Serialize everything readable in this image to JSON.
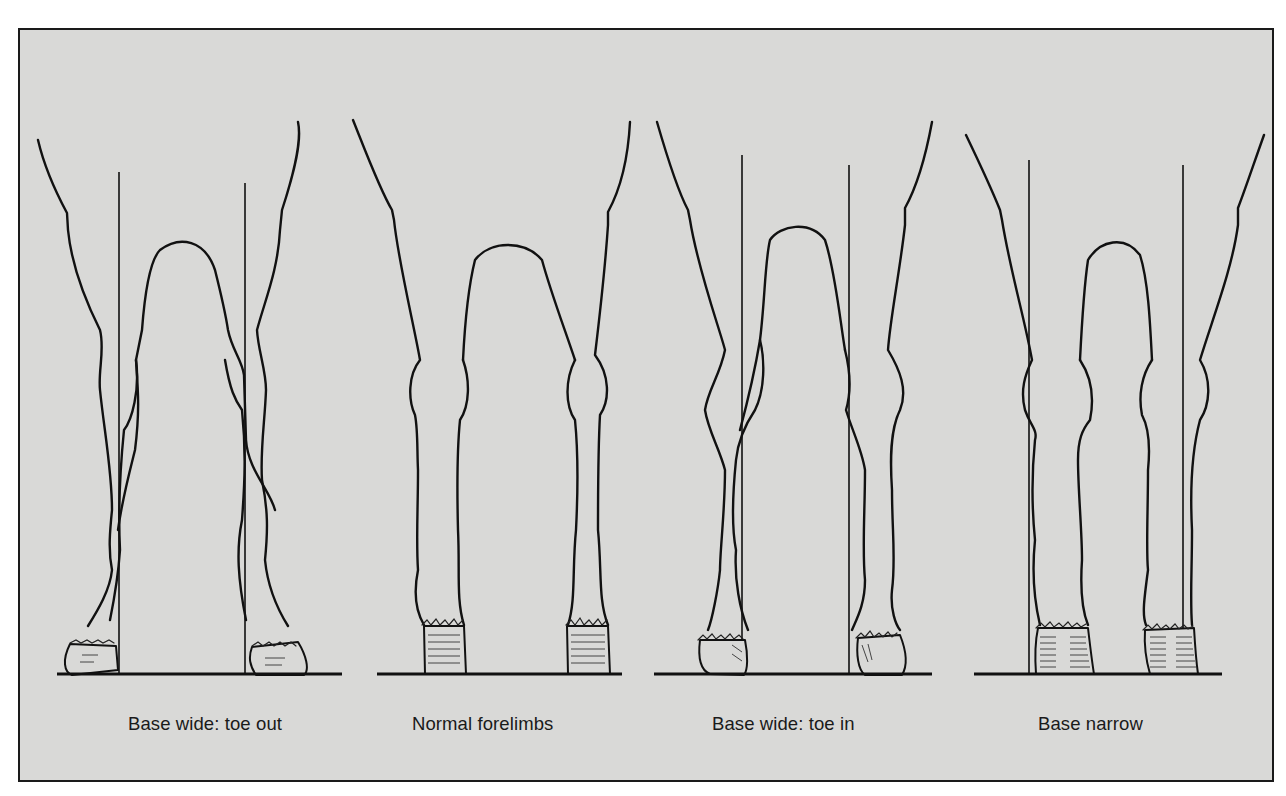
{
  "page": {
    "top_cutoff_text": ""
  },
  "figure": {
    "background_color": "#d9d9d7",
    "border_color": "#1a1a1a",
    "panels": [
      {
        "id": "base-wide-toe-out",
        "caption": "Base wide: toe out",
        "plumb_lines": true
      },
      {
        "id": "normal-forelimbs",
        "caption": "Normal forelimbs",
        "plumb_lines": false
      },
      {
        "id": "base-wide-toe-in",
        "caption": "Base wide: toe in",
        "plumb_lines": true
      },
      {
        "id": "base-narrow",
        "caption": "Base narrow",
        "plumb_lines": true
      }
    ]
  }
}
